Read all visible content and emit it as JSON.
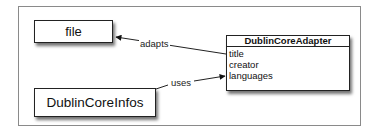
{
  "diagram": {
    "nodes": [
      {
        "id": "file",
        "label": "file"
      },
      {
        "id": "dublin_core_infos",
        "label": "DublinCoreInfos"
      },
      {
        "id": "dublin_core_adapter",
        "label": "DublinCoreAdapter",
        "attributes": [
          "title",
          "creator",
          "languages"
        ]
      }
    ],
    "edges": [
      {
        "from": "dublin_core_adapter",
        "to": "file",
        "label": "adapts"
      },
      {
        "from": "dublin_core_infos",
        "to": "dublin_core_adapter",
        "label": "uses"
      }
    ]
  }
}
